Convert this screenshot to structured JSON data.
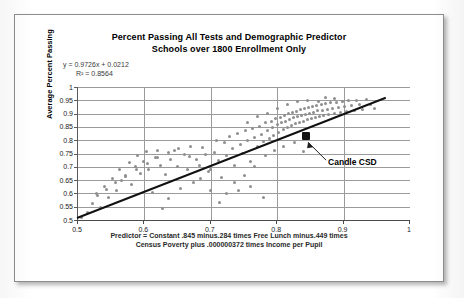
{
  "chart_data": {
    "type": "scatter",
    "title": "Percent Passing All  Tests and Demographic Predictor",
    "subtitle": "Schools over 1800 Enrollment Only",
    "xlabel": "",
    "ylabel": "Average Percent Passing",
    "xlim": [
      0.5,
      1
    ],
    "ylim": [
      0.5,
      1
    ],
    "x_ticks": [
      "0.5",
      "0.6",
      "0.7",
      "0.8",
      "0.9",
      "1"
    ],
    "y_ticks": [
      "1",
      "0.95",
      "0.9",
      "0.85",
      "0.8",
      "0.75",
      "0.7",
      "0.65",
      "0.6",
      "0.55",
      "0.5"
    ],
    "grid": "horizontal-and-vertical",
    "legend": "none",
    "series_color": "#8e8e8e",
    "trendline_color": "#111111",
    "highlight_color": "#121212",
    "annotations": {
      "equation": "y = 0.9726x + 0.0212",
      "r_squared": "R² = 0.8564",
      "highlight_label": "Candle CSD",
      "highlight_point": [
        0.845,
        0.815
      ],
      "footnote_line_1": "Predictor = Constant .845 minus.284 times Free Lunch minus.449 times",
      "footnote_line_2": "Census  Poverty plus  .000000372  times Income per Pupil"
    },
    "trendline": {
      "slope": 0.9726,
      "intercept": 0.0212,
      "x_start": 0.5,
      "x_end": 0.965
    },
    "points": [
      [
        0.505,
        0.508
      ],
      [
        0.515,
        0.527
      ],
      [
        0.522,
        0.563
      ],
      [
        0.528,
        0.6
      ],
      [
        0.534,
        0.548
      ],
      [
        0.54,
        0.625
      ],
      [
        0.546,
        0.585
      ],
      [
        0.552,
        0.655
      ],
      [
        0.558,
        0.612
      ],
      [
        0.563,
        0.69
      ],
      [
        0.566,
        0.648
      ],
      [
        0.572,
        0.667
      ],
      [
        0.578,
        0.715
      ],
      [
        0.581,
        0.632
      ],
      [
        0.586,
        0.7
      ],
      [
        0.59,
        0.742
      ],
      [
        0.594,
        0.676
      ],
      [
        0.599,
        0.721
      ],
      [
        0.603,
        0.757
      ],
      [
        0.606,
        0.69
      ],
      [
        0.612,
        0.604
      ],
      [
        0.616,
        0.735
      ],
      [
        0.62,
        0.763
      ],
      [
        0.624,
        0.706
      ],
      [
        0.628,
        0.545
      ],
      [
        0.632,
        0.672
      ],
      [
        0.636,
        0.58
      ],
      [
        0.64,
        0.726
      ],
      [
        0.645,
        0.76
      ],
      [
        0.65,
        0.7
      ],
      [
        0.655,
        0.62
      ],
      [
        0.66,
        0.745
      ],
      [
        0.665,
        0.69
      ],
      [
        0.67,
        0.775
      ],
      [
        0.674,
        0.64
      ],
      [
        0.678,
        0.727
      ],
      [
        0.683,
        0.704
      ],
      [
        0.688,
        0.773
      ],
      [
        0.692,
        0.747
      ],
      [
        0.696,
        0.681
      ],
      [
        0.7,
        0.612
      ],
      [
        0.705,
        0.755
      ],
      [
        0.708,
        0.8
      ],
      [
        0.712,
        0.724
      ],
      [
        0.716,
        0.66
      ],
      [
        0.72,
        0.791
      ],
      [
        0.724,
        0.742
      ],
      [
        0.728,
        0.815
      ],
      [
        0.732,
        0.769
      ],
      [
        0.736,
        0.706
      ],
      [
        0.74,
        0.826
      ],
      [
        0.744,
        0.782
      ],
      [
        0.748,
        0.75
      ],
      [
        0.752,
        0.835
      ],
      [
        0.756,
        0.8
      ],
      [
        0.76,
        0.72
      ],
      [
        0.763,
        0.845
      ],
      [
        0.766,
        0.812
      ],
      [
        0.77,
        0.778
      ],
      [
        0.773,
        0.853
      ],
      [
        0.776,
        0.823
      ],
      [
        0.779,
        0.795
      ],
      [
        0.782,
        0.865
      ],
      [
        0.785,
        0.836
      ],
      [
        0.788,
        0.806
      ],
      [
        0.791,
        0.872
      ],
      [
        0.793,
        0.847
      ],
      [
        0.795,
        0.818
      ],
      [
        0.798,
        0.88
      ],
      [
        0.8,
        0.858
      ],
      [
        0.802,
        0.828
      ],
      [
        0.805,
        0.887
      ],
      [
        0.807,
        0.866
      ],
      [
        0.809,
        0.84
      ],
      [
        0.811,
        0.893
      ],
      [
        0.813,
        0.872
      ],
      [
        0.815,
        0.849
      ],
      [
        0.817,
        0.899
      ],
      [
        0.819,
        0.878
      ],
      [
        0.821,
        0.856
      ],
      [
        0.823,
        0.904
      ],
      [
        0.825,
        0.884
      ],
      [
        0.827,
        0.862
      ],
      [
        0.829,
        0.909
      ],
      [
        0.831,
        0.889
      ],
      [
        0.833,
        0.868
      ],
      [
        0.835,
        0.914
      ],
      [
        0.837,
        0.893
      ],
      [
        0.839,
        0.872
      ],
      [
        0.841,
        0.918
      ],
      [
        0.843,
        0.898
      ],
      [
        0.845,
        0.877
      ],
      [
        0.847,
        0.922
      ],
      [
        0.849,
        0.902
      ],
      [
        0.851,
        0.882
      ],
      [
        0.853,
        0.926
      ],
      [
        0.855,
        0.906
      ],
      [
        0.857,
        0.886
      ],
      [
        0.859,
        0.93
      ],
      [
        0.861,
        0.91
      ],
      [
        0.863,
        0.89
      ],
      [
        0.866,
        0.933
      ],
      [
        0.868,
        0.913
      ],
      [
        0.87,
        0.894
      ],
      [
        0.873,
        0.937
      ],
      [
        0.875,
        0.917
      ],
      [
        0.878,
        0.897
      ],
      [
        0.88,
        0.94
      ],
      [
        0.883,
        0.92
      ],
      [
        0.886,
        0.901
      ],
      [
        0.889,
        0.943
      ],
      [
        0.892,
        0.923
      ],
      [
        0.895,
        0.904
      ],
      [
        0.898,
        0.946
      ],
      [
        0.901,
        0.927
      ],
      [
        0.905,
        0.908
      ],
      [
        0.908,
        0.949
      ],
      [
        0.912,
        0.93
      ],
      [
        0.916,
        0.912
      ],
      [
        0.92,
        0.951
      ],
      [
        0.924,
        0.933
      ],
      [
        0.929,
        0.916
      ],
      [
        0.934,
        0.953
      ],
      [
        0.94,
        0.936
      ],
      [
        0.947,
        0.921
      ],
      [
        0.782,
        0.742
      ],
      [
        0.796,
        0.76
      ],
      [
        0.81,
        0.775
      ],
      [
        0.826,
        0.79
      ],
      [
        0.84,
        0.757
      ],
      [
        0.756,
        0.868
      ],
      [
        0.77,
        0.888
      ],
      [
        0.786,
        0.902
      ],
      [
        0.8,
        0.92
      ],
      [
        0.815,
        0.935
      ],
      [
        0.735,
        0.64
      ],
      [
        0.75,
        0.668
      ],
      [
        0.766,
        0.7
      ],
      [
        0.7,
        0.688
      ],
      [
        0.684,
        0.655
      ],
      [
        0.668,
        0.74
      ],
      [
        0.652,
        0.77
      ],
      [
        0.636,
        0.755
      ],
      [
        0.62,
        0.735
      ],
      [
        0.604,
        0.712
      ],
      [
        0.588,
        0.688
      ],
      [
        0.572,
        0.663
      ],
      [
        0.556,
        0.64
      ],
      [
        0.543,
        0.615
      ],
      [
        0.53,
        0.592
      ],
      [
        0.873,
        0.962
      ],
      [
        0.886,
        0.955
      ],
      [
        0.845,
        0.95
      ],
      [
        0.83,
        0.945
      ],
      [
        0.862,
        0.944
      ],
      [
        0.724,
        0.598
      ],
      [
        0.742,
        0.612
      ],
      [
        0.76,
        0.625
      ],
      [
        0.779,
        0.586
      ],
      [
        0.713,
        0.565
      ]
    ]
  }
}
